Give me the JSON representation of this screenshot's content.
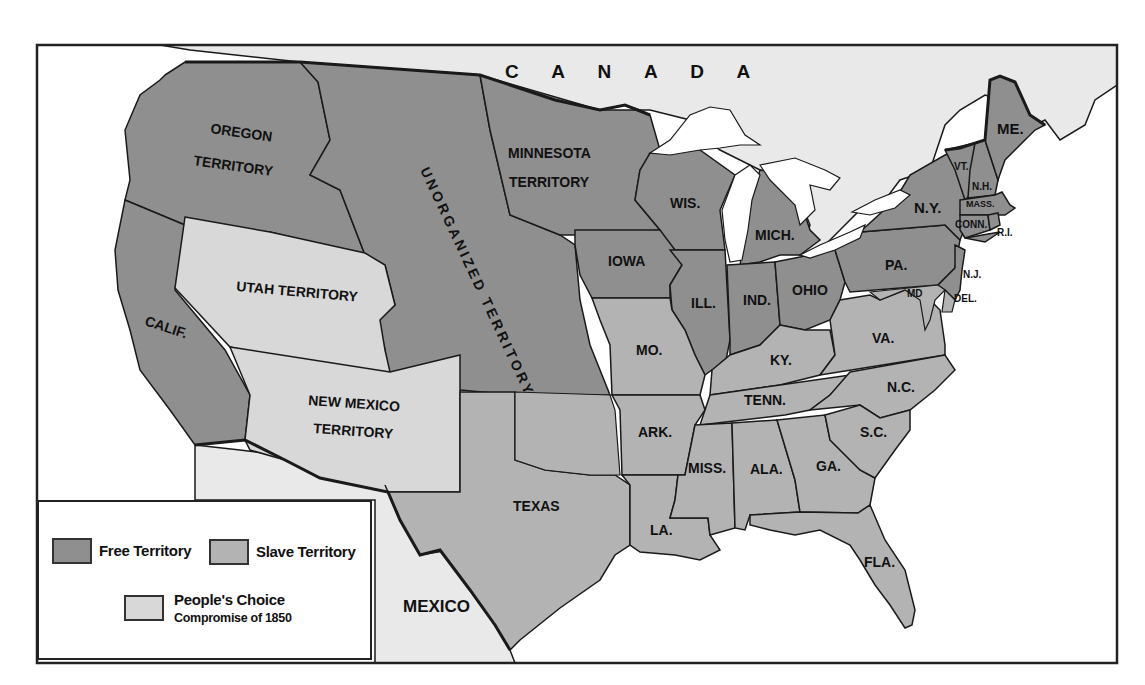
{
  "title": "",
  "colors": {
    "free": "#8f8f8f",
    "slave": "#b3b3b3",
    "peoples_choice": "#d8d8d8",
    "foreign": "#e9e9e9",
    "water": "#ffffff",
    "border": "#1a1a1a"
  },
  "countries": {
    "canada": "C A N A D A",
    "mexico": "MEXICO"
  },
  "territories": {
    "oregon_1": "OREGON",
    "oregon_2": "TERRITORY",
    "unorganized": "UNORGANIZED TERRITORY",
    "minnesota_1": "MINNESOTA",
    "minnesota_2": "TERRITORY",
    "utah": "UTAH TERRITORY",
    "new_mexico_1": "NEW MEXICO",
    "new_mexico_2": "TERRITORY"
  },
  "states": {
    "calif": "CALIF.",
    "texas": "TEXAS",
    "iowa": "IOWA",
    "wis": "WIS.",
    "mich": "MICH.",
    "ill": "ILL.",
    "ind": "IND.",
    "ohio": "OHIO",
    "pa": "PA.",
    "ny": "N.Y.",
    "vt": "VT.",
    "nh": "N.H.",
    "me": "ME.",
    "mass": "MASS.",
    "conn": "CONN.",
    "ri": "R.I.",
    "nj": "N.J.",
    "md": "MD",
    "del": "DEL.",
    "mo": "MO.",
    "ky": "KY.",
    "va": "VA.",
    "tenn": "TENN.",
    "nc": "N.C.",
    "ark": "ARK.",
    "sc": "S.C.",
    "miss": "MISS.",
    "ala": "ALA.",
    "ga": "GA.",
    "la": "LA.",
    "fla": "FLA."
  },
  "legend": {
    "free": "Free Territory",
    "slave": "Slave Territory",
    "peoples_choice": "People's Choice",
    "peoples_choice_sub": "Compromise of 1850"
  }
}
